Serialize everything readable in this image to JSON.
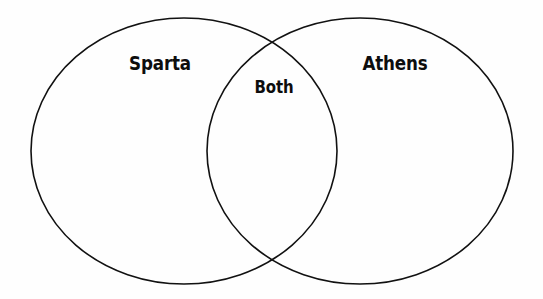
{
  "diagram": {
    "type": "venn",
    "background_color": "#fefefe",
    "stroke_color": "#111111",
    "text_color": "#0d0d0d",
    "sets": [
      {
        "id": "left",
        "label": "Sparta",
        "cx": 184,
        "cy": 151,
        "rx": 153,
        "ry": 133
      },
      {
        "id": "right",
        "label": "Athens",
        "cx": 360,
        "cy": 151,
        "rx": 153,
        "ry": 133
      }
    ],
    "intersection": {
      "label": "Both"
    },
    "labels": {
      "left_set": "Sparta",
      "intersection": "Both",
      "right_set": "Athens"
    }
  }
}
